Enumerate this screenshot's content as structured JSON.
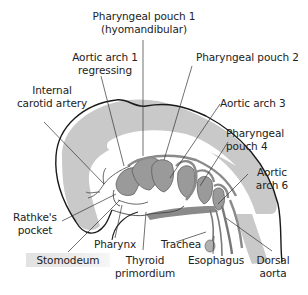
{
  "diagram": {
    "colors": {
      "outline": "#1a1a1a",
      "tissue_light": "#c9c9c9",
      "structure_dark": "#9a9a9a",
      "vessel": "#8a8a8a",
      "background": "#ffffff"
    },
    "labels": {
      "pharyngeal_pouch_1": {
        "line1": "Pharyngeal pouch 1",
        "line2": "(hyomandibular)"
      },
      "aortic_arch_1": {
        "line1": "Aortic arch 1",
        "line2": "regressing"
      },
      "pharyngeal_pouch_2": {
        "line1": "Pharyngeal pouch 2"
      },
      "internal_carotid": {
        "line1": "Internal",
        "line2": "carotid artery"
      },
      "aortic_arch_3": {
        "line1": "Aortic arch 3"
      },
      "pharyngeal_pouch_4": {
        "line1": "Pharyngeal",
        "line2": "pouch 4"
      },
      "aortic_arch_6": {
        "line1": "Aortic",
        "line2": "arch 6"
      },
      "rathkes_pocket": {
        "line1": "Rathke's",
        "line2": "pocket"
      },
      "pharynx": {
        "line1": "Pharynx"
      },
      "trachea": {
        "line1": "Trachea"
      },
      "stomodeum": {
        "line1": "Stomodeum"
      },
      "thyroid_primordium": {
        "line1": "Thyroid",
        "line2": "primordium"
      },
      "esophagus": {
        "line1": "Esophagus"
      },
      "dorsal_aorta": {
        "line1": "Dorsal",
        "line2": "aorta"
      }
    }
  }
}
